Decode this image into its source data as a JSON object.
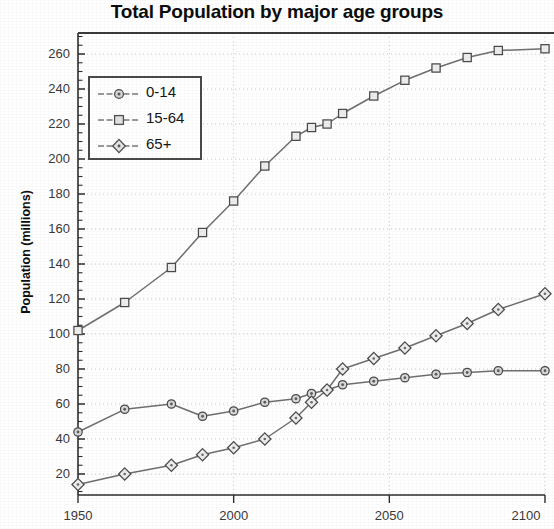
{
  "chart_data": {
    "type": "line",
    "title": "Total Population by major age groups",
    "xlabel": "",
    "ylabel": "Population (millions)",
    "xlim": [
      1950,
      2100
    ],
    "ylim": [
      8,
      272
    ],
    "xticks": [
      1950,
      2000,
      2050,
      2100
    ],
    "yticks": [
      20,
      40,
      60,
      80,
      100,
      120,
      140,
      160,
      180,
      200,
      220,
      240,
      260
    ],
    "grid": true,
    "legend_position": "upper left",
    "x": [
      1950,
      1965,
      1980,
      1990,
      2000,
      2010,
      2020,
      2025,
      2030,
      2035,
      2045,
      2055,
      2065,
      2075,
      2085,
      2100
    ],
    "series": [
      {
        "name": "0-14",
        "marker": "circle",
        "values": [
          44,
          57,
          60,
          53,
          56,
          61,
          63,
          66,
          68,
          71,
          73,
          75,
          77,
          78,
          79,
          79
        ]
      },
      {
        "name": "15-64",
        "marker": "square",
        "values": [
          102,
          118,
          138,
          158,
          176,
          196,
          213,
          218,
          220,
          226,
          236,
          245,
          252,
          258,
          262,
          263
        ]
      },
      {
        "name": "65+",
        "marker": "diamond",
        "values": [
          14,
          20,
          25,
          31,
          35,
          40,
          52,
          61,
          68,
          80,
          86,
          92,
          99,
          106,
          114,
          123
        ]
      }
    ]
  },
  "axis": {
    "y_tick_labels": [
      "260",
      "240",
      "220",
      "200",
      "180",
      "160",
      "140",
      "120",
      "100",
      "80",
      "60",
      "40",
      "20"
    ],
    "x_tick_labels": [
      "1950",
      "2000",
      "2050",
      "2100"
    ]
  },
  "legend": {
    "items": [
      {
        "label": "0-14"
      },
      {
        "label": "15-64"
      },
      {
        "label": "65+"
      }
    ]
  },
  "colors": {
    "line": "#6f6f6f",
    "axis": "#2e2e2e",
    "grid": "#c9c9c9",
    "text": "#0d0d0d"
  }
}
